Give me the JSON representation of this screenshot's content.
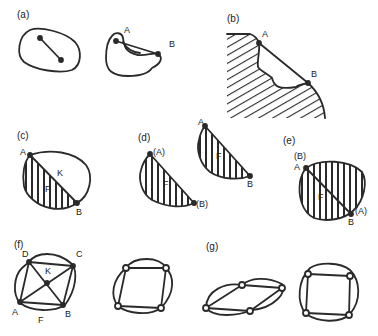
{
  "panels": {
    "a": {
      "label": "(a)",
      "points": [
        "A",
        "B"
      ]
    },
    "b": {
      "label": "(b)",
      "points": [
        "A",
        "B"
      ]
    },
    "c": {
      "label": "(c)",
      "points": [
        "A",
        "K",
        "F",
        "B"
      ]
    },
    "d": {
      "label": "(d)",
      "points_left": [
        "(A)",
        "F",
        "(B)"
      ],
      "points_right": [
        "A",
        "F",
        "B"
      ]
    },
    "e": {
      "label": "(e)",
      "points": [
        "(B)",
        "A",
        "F",
        "(A)",
        "B"
      ]
    },
    "f": {
      "label": "(f)",
      "points": [
        "D",
        "C",
        "K",
        "A",
        "F",
        "B"
      ]
    },
    "g": {
      "label": "(g)"
    }
  },
  "colors": {
    "stroke": "#2a2a2a",
    "background": "#ffffff"
  }
}
